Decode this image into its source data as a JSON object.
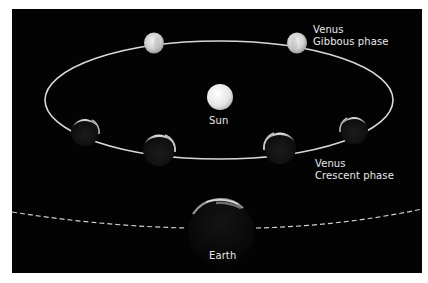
{
  "diagram": {
    "background_color": "#030303",
    "page_color": "#ffffff",
    "orbit": {
      "name": "venus-orbit",
      "cx": 219,
      "cy": 100,
      "rx": 174,
      "ry": 59,
      "stroke": "#d8d8d8"
    },
    "earth_orbit": {
      "name": "earth-orbit-dashed",
      "stroke": "#cfcfcf",
      "style": "dashed"
    },
    "labels": {
      "venus_gibbous_line1": "Venus",
      "venus_gibbous_line2": "Gibbous phase",
      "sun": "Sun",
      "venus_crescent_line1": "Venus",
      "venus_crescent_line2": "Crescent phase",
      "earth": "Earth"
    },
    "bodies": [
      {
        "name": "venus-gibbous-left",
        "phase": "gibbous",
        "cx": 154,
        "cy": 43,
        "r": 10
      },
      {
        "name": "venus-gibbous-right",
        "phase": "gibbous",
        "cx": 297,
        "cy": 43,
        "r": 10
      },
      {
        "name": "sun",
        "phase": "full",
        "cx": 220,
        "cy": 97,
        "r": 13
      },
      {
        "name": "venus-crescent-1",
        "phase": "crescent",
        "cx": 85,
        "cy": 132,
        "r": 14
      },
      {
        "name": "venus-crescent-2",
        "phase": "crescent",
        "cx": 159,
        "cy": 150,
        "r": 16
      },
      {
        "name": "venus-crescent-3",
        "phase": "crescent",
        "cx": 280,
        "cy": 148,
        "r": 16
      },
      {
        "name": "venus-crescent-4",
        "phase": "crescent",
        "cx": 354,
        "cy": 130,
        "r": 14
      },
      {
        "name": "earth",
        "phase": "night-side",
        "cx": 221,
        "cy": 232,
        "r": 33
      }
    ]
  }
}
